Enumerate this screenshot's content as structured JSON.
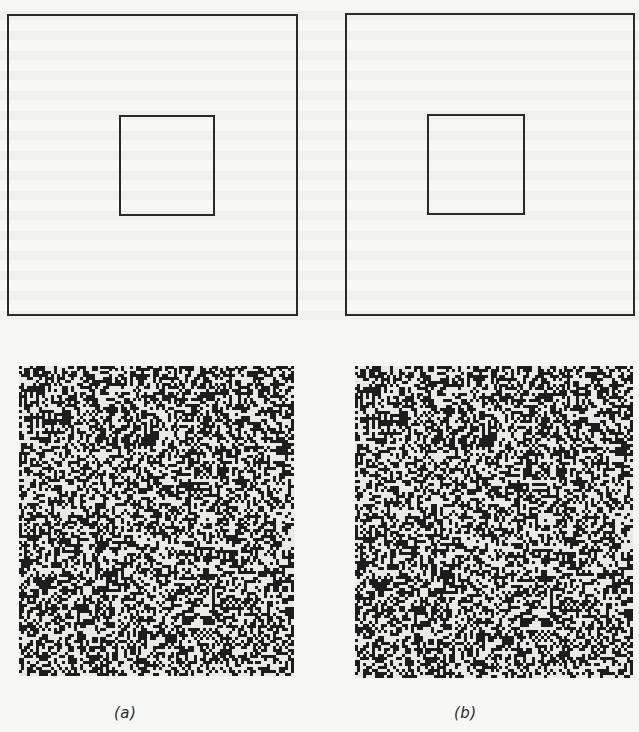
{
  "figure": {
    "panels": [
      {
        "id": "a",
        "caption": "(a)",
        "diagram": {
          "outer_square": {
            "x": 7,
            "y": 14,
            "w": 291,
            "h": 302
          },
          "inner_square": {
            "x": 119,
            "y": 115,
            "w": 96,
            "h": 101
          }
        },
        "stereogram": {
          "x": 19,
          "y": 366,
          "w": 275,
          "h": 310,
          "seed": 7
        },
        "caption_pos": {
          "x": 114,
          "y": 704
        }
      },
      {
        "id": "b",
        "caption": "(b)",
        "diagram": {
          "outer_square": {
            "x": 345,
            "y": 13,
            "w": 290,
            "h": 303
          },
          "inner_square": {
            "x": 427,
            "y": 114,
            "w": 98,
            "h": 101
          }
        },
        "stereogram": {
          "x": 355,
          "y": 366,
          "w": 278,
          "h": 312,
          "seed": 7
        },
        "caption_pos": {
          "x": 454,
          "y": 704
        }
      }
    ],
    "colors": {
      "paper": "#f7f7f5",
      "ink": "#2a2a2a",
      "dot_dark": "#1d1d1d",
      "dot_light": "#e9e9e6"
    }
  }
}
